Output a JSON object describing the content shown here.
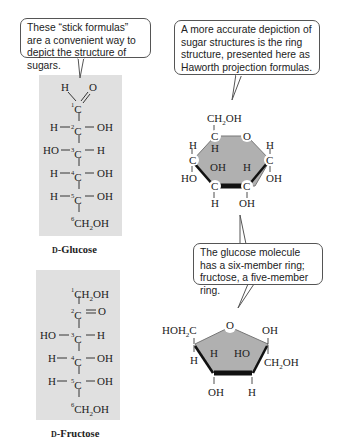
{
  "callouts": {
    "stick": "These “stick formulas” are a convenient way to depict the structure of sugars.",
    "ring": "A more accurate depiction of sugar structures is the ring structure, presented here as Haworth projection formulas.",
    "members": "The glucose molecule has a six-member ring; fructose, a five-member ring."
  },
  "glucose": {
    "label_prefix": "D",
    "label_name": "-Glucose",
    "c1_top_h": "H",
    "c1_top_o": "O",
    "rows": [
      {
        "num": "1",
        "left": "",
        "right": ""
      },
      {
        "num": "2",
        "left": "H",
        "right": "OH"
      },
      {
        "num": "3",
        "left": "HO",
        "right": "H"
      },
      {
        "num": "4",
        "left": "H",
        "right": "OH"
      },
      {
        "num": "5",
        "left": "H",
        "right": "OH"
      },
      {
        "num": "6",
        "left": "",
        "right": ""
      }
    ],
    "c6_group": "CH2OH"
  },
  "fructose": {
    "label_prefix": "D",
    "label_name": "-Fructose",
    "c1_group": "CH2OH",
    "c2_right": "O",
    "rows": [
      {
        "num": "1",
        "left": "",
        "right": ""
      },
      {
        "num": "2",
        "left": "",
        "right": "O"
      },
      {
        "num": "3",
        "left": "HO",
        "right": "H"
      },
      {
        "num": "4",
        "left": "H",
        "right": "OH"
      },
      {
        "num": "5",
        "left": "H",
        "right": "OH"
      },
      {
        "num": "6",
        "left": "",
        "right": ""
      }
    ],
    "c6_group": "CH2OH"
  },
  "glucose_ring": {
    "top_group": "CH2OH",
    "ring_o": "O",
    "atoms": [
      "C",
      "C",
      "C",
      "C",
      "C"
    ],
    "substituents": [
      "H",
      "HO",
      "H",
      "OH",
      "H",
      "H",
      "OH",
      "H",
      "OH",
      "OH"
    ]
  },
  "fructose_ring": {
    "left_group": "HOH2C",
    "ring_o": "O",
    "right_top": "OH",
    "right_bottom": "CH2OH",
    "subs": [
      "H",
      "H",
      "HO",
      "OH",
      "H"
    ]
  },
  "colors": {
    "panel": "#e0e0e0",
    "ring_fill": "#b0b0b0",
    "line": "#222222"
  }
}
